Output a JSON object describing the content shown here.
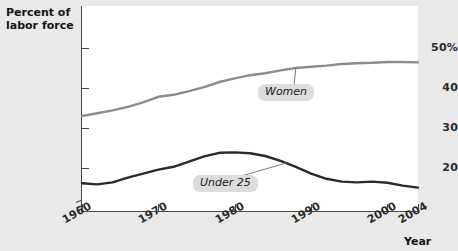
{
  "chart_data": {
    "type": "line",
    "title": "",
    "xlabel": "Year",
    "ylabel": "Percent of labor force",
    "xlim": [
      1960,
      2004
    ],
    "ylim": [
      13,
      51
    ],
    "grid": false,
    "legend_position": "inline-callout",
    "axis_break_y": true,
    "y_ticks": [
      "50%",
      "40",
      "30",
      "20"
    ],
    "y_tick_values": [
      50,
      40,
      30,
      20
    ],
    "x_ticks": [
      "1960",
      "1970",
      "1980",
      "1990",
      "2000",
      "2004"
    ],
    "x_tick_values": [
      1960,
      1970,
      1980,
      1990,
      2000,
      2004
    ],
    "series": [
      {
        "name": "Women",
        "color": "#8c8c8c",
        "x": [
          1960,
          1962,
          1964,
          1966,
          1968,
          1970,
          1972,
          1974,
          1976,
          1978,
          1980,
          1982,
          1984,
          1986,
          1988,
          1990,
          1992,
          1994,
          1996,
          1998,
          2000,
          2002,
          2004
        ],
        "values": [
          33.0,
          33.7,
          34.4,
          35.3,
          36.4,
          37.8,
          38.3,
          39.2,
          40.2,
          41.5,
          42.4,
          43.2,
          43.7,
          44.4,
          45.0,
          45.3,
          45.6,
          46.0,
          46.2,
          46.3,
          46.5,
          46.5,
          46.4
        ]
      },
      {
        "name": "Under 25",
        "color": "#2a2a2a",
        "x": [
          1960,
          1962,
          1964,
          1966,
          1968,
          1970,
          1972,
          1974,
          1976,
          1978,
          1980,
          1982,
          1984,
          1986,
          1988,
          1990,
          1992,
          1994,
          1996,
          1998,
          2000,
          2002,
          2004
        ],
        "values": [
          16.2,
          15.9,
          16.4,
          17.6,
          18.6,
          19.6,
          20.3,
          21.6,
          22.9,
          23.8,
          23.9,
          23.7,
          23.0,
          21.8,
          20.3,
          18.6,
          17.3,
          16.6,
          16.4,
          16.6,
          16.3,
          15.6,
          15.1
        ]
      }
    ],
    "annotations": [
      {
        "text": "Women",
        "series": "Women",
        "anchor_x": 1988,
        "anchor_y": 45.0
      },
      {
        "text": "Under 25",
        "series": "Under 25",
        "anchor_x": 1987,
        "anchor_y": 21.4
      }
    ]
  },
  "axes": {
    "y_title_line1": "Percent of",
    "y_title_line2": "labor force",
    "x_title": "Year"
  }
}
